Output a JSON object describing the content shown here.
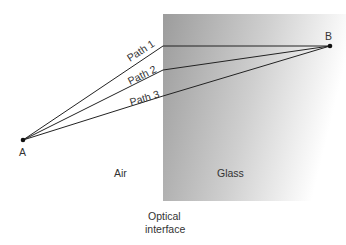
{
  "diagram": {
    "points": {
      "A": "A",
      "B": "B"
    },
    "paths": [
      "Path 1",
      "Path 2",
      "Path 3"
    ],
    "regions": {
      "air": "Air",
      "glass": "Glass"
    },
    "interface_label_line1": "Optical",
    "interface_label_line2": "interface",
    "colors": {
      "glass_dark": "#9a9a9a",
      "glass_light": "#ffffff",
      "line": "#222222"
    }
  }
}
